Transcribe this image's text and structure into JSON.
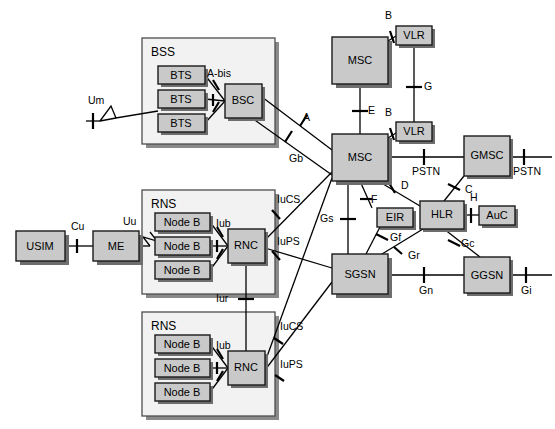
{
  "diagram": {
    "colors": {
      "node_fill": "#c9c9c9",
      "group_fill": "#f2f2f2",
      "stroke": "#000000",
      "shadow": "#6e6e6e"
    }
  },
  "groups": [
    {
      "id": "bss",
      "label": "BSS",
      "x": 142,
      "y": 38,
      "w": 133,
      "h": 106
    },
    {
      "id": "rns1",
      "label": "RNS",
      "x": 142,
      "y": 190,
      "w": 133,
      "h": 104
    },
    {
      "id": "rns2",
      "label": "RNS",
      "x": 142,
      "y": 312,
      "w": 133,
      "h": 104
    }
  ],
  "nodes": [
    {
      "id": "usim",
      "label": "USIM",
      "x": 16,
      "y": 231,
      "w": 49,
      "h": 30
    },
    {
      "id": "me",
      "label": "ME",
      "x": 93,
      "y": 231,
      "w": 46,
      "h": 30
    },
    {
      "id": "bts1",
      "label": "BTS",
      "x": 158,
      "y": 66,
      "w": 47,
      "h": 18
    },
    {
      "id": "bts2",
      "label": "BTS",
      "x": 158,
      "y": 90,
      "w": 47,
      "h": 18
    },
    {
      "id": "bts3",
      "label": "BTS",
      "x": 158,
      "y": 114,
      "w": 47,
      "h": 18
    },
    {
      "id": "bsc",
      "label": "BSC",
      "x": 225,
      "y": 84,
      "w": 37,
      "h": 34
    },
    {
      "id": "nodeb1",
      "label": "Node B",
      "x": 155,
      "y": 213,
      "w": 55,
      "h": 18
    },
    {
      "id": "nodeb2",
      "label": "Node B",
      "x": 155,
      "y": 237,
      "w": 55,
      "h": 18
    },
    {
      "id": "nodeb3",
      "label": "Node B",
      "x": 155,
      "y": 261,
      "w": 55,
      "h": 18
    },
    {
      "id": "rnc1",
      "label": "RNC",
      "x": 228,
      "y": 229,
      "w": 37,
      "h": 34
    },
    {
      "id": "nodeb4",
      "label": "Node B",
      "x": 155,
      "y": 335,
      "w": 55,
      "h": 18
    },
    {
      "id": "nodeb5",
      "label": "Node B",
      "x": 155,
      "y": 359,
      "w": 55,
      "h": 18
    },
    {
      "id": "nodeb6",
      "label": "Node B",
      "x": 155,
      "y": 383,
      "w": 55,
      "h": 18
    },
    {
      "id": "rnc2",
      "label": "RNC",
      "x": 228,
      "y": 351,
      "w": 37,
      "h": 34
    },
    {
      "id": "msc1",
      "label": "MSC",
      "x": 332,
      "y": 37,
      "w": 56,
      "h": 47
    },
    {
      "id": "vlr1",
      "label": "VLR",
      "x": 396,
      "y": 26,
      "w": 36,
      "h": 19
    },
    {
      "id": "msc2",
      "label": "MSC",
      "x": 332,
      "y": 134,
      "w": 56,
      "h": 47
    },
    {
      "id": "vlr2",
      "label": "VLR",
      "x": 396,
      "y": 122,
      "w": 36,
      "h": 19
    },
    {
      "id": "gmsc",
      "label": "GMSC",
      "x": 464,
      "y": 136,
      "w": 46,
      "h": 40
    },
    {
      "id": "eir",
      "label": "EIR",
      "x": 377,
      "y": 208,
      "w": 36,
      "h": 19
    },
    {
      "id": "hlr",
      "label": "HLR",
      "x": 420,
      "y": 201,
      "w": 44,
      "h": 28
    },
    {
      "id": "auc",
      "label": "AuC",
      "x": 479,
      "y": 206,
      "w": 36,
      "h": 19
    },
    {
      "id": "sgsn",
      "label": "SGSN",
      "x": 332,
      "y": 254,
      "w": 56,
      "h": 40
    },
    {
      "id": "ggsn",
      "label": "GGSN",
      "x": 464,
      "y": 257,
      "w": 46,
      "h": 36
    }
  ],
  "interfaces": [
    {
      "id": "cu",
      "label": "Cu",
      "x": 71,
      "y": 227
    },
    {
      "id": "uu",
      "label": "Uu",
      "x": 123,
      "y": 222
    },
    {
      "id": "um",
      "label": "Um",
      "x": 88,
      "y": 101
    },
    {
      "id": "abis",
      "label": "A-bis",
      "x": 207,
      "y": 74
    },
    {
      "id": "a",
      "label": "A",
      "x": 303,
      "y": 118
    },
    {
      "id": "gb",
      "label": "Gb",
      "x": 289,
      "y": 159
    },
    {
      "id": "iub1",
      "label": "Iub",
      "x": 216,
      "y": 224
    },
    {
      "id": "iucs1",
      "label": "IuCS",
      "x": 277,
      "y": 200
    },
    {
      "id": "iups1",
      "label": "IuPS",
      "x": 277,
      "y": 242
    },
    {
      "id": "iur",
      "label": "Iur",
      "x": 216,
      "y": 299
    },
    {
      "id": "iub2",
      "label": "Iub",
      "x": 216,
      "y": 346
    },
    {
      "id": "iucs2",
      "label": "IuCS",
      "x": 280,
      "y": 327
    },
    {
      "id": "iups2",
      "label": "IuPS",
      "x": 280,
      "y": 365
    },
    {
      "id": "b1",
      "label": "B",
      "x": 385,
      "y": 16
    },
    {
      "id": "b2",
      "label": "B",
      "x": 385,
      "y": 113
    },
    {
      "id": "e",
      "label": "E",
      "x": 368,
      "y": 111
    },
    {
      "id": "g",
      "label": "G",
      "x": 424,
      "y": 87
    },
    {
      "id": "pstn1",
      "label": "PSTN",
      "x": 412,
      "y": 172
    },
    {
      "id": "pstn2",
      "label": "PSTN",
      "x": 513,
      "y": 172
    },
    {
      "id": "c",
      "label": "C",
      "x": 465,
      "y": 190
    },
    {
      "id": "d",
      "label": "D",
      "x": 401,
      "y": 186
    },
    {
      "id": "f",
      "label": "F",
      "x": 371,
      "y": 200
    },
    {
      "id": "h",
      "label": "H",
      "x": 470,
      "y": 198
    },
    {
      "id": "gs",
      "label": "Gs",
      "x": 330,
      "y": 219
    },
    {
      "id": "gf",
      "label": "Gf",
      "x": 390,
      "y": 238
    },
    {
      "id": "gr",
      "label": "Gr",
      "x": 408,
      "y": 256
    },
    {
      "id": "gc",
      "label": "Gc",
      "x": 461,
      "y": 244
    },
    {
      "id": "gn",
      "label": "Gn",
      "x": 419,
      "y": 291
    },
    {
      "id": "gi",
      "label": "Gi",
      "x": 521,
      "y": 291
    }
  ]
}
